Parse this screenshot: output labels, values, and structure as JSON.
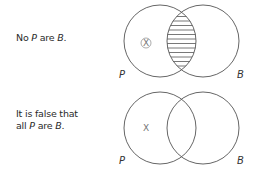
{
  "diagrams": [
    {
      "statement": {
        "prefix": "No ",
        "term1": "P",
        "middle": " are ",
        "term2": "B",
        "suffix": "."
      },
      "left_label": "P",
      "right_label": "B",
      "marker": "X",
      "marker_style": "circled",
      "shaded_region": "intersection"
    },
    {
      "statement": {
        "line1": "It is false that",
        "prefix": "all ",
        "term1": "P",
        "middle": " are ",
        "term2": "B",
        "suffix": "."
      },
      "left_label": "P",
      "right_label": "B",
      "marker": "X",
      "marker_style": "plain",
      "shaded_region": "none"
    }
  ],
  "colors": {
    "stroke": "#555555",
    "text": "#2a2a2a",
    "marker": "#777777"
  }
}
